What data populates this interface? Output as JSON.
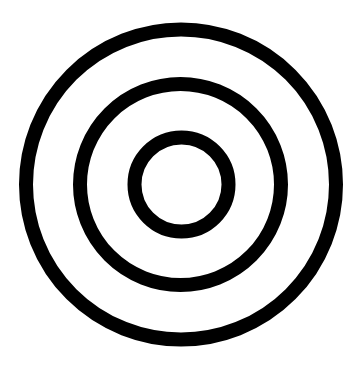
{
  "graphic": {
    "name": "concentric-circles",
    "ring_count": 3,
    "colors": {
      "background": "#ffffff",
      "stroke": "#000000"
    },
    "rings": [
      {
        "id": "outer-ring"
      },
      {
        "id": "middle-ring"
      },
      {
        "id": "inner-ring"
      }
    ]
  }
}
